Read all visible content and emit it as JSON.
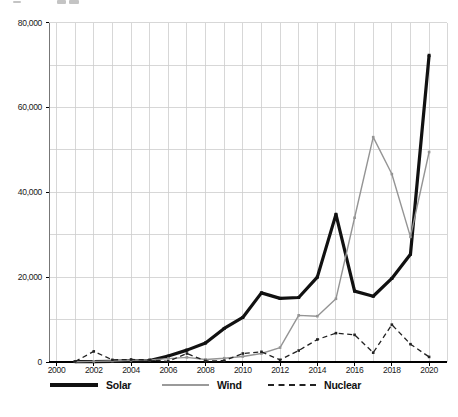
{
  "chart_data": {
    "type": "line",
    "title": "",
    "xlabel": "",
    "ylabel": "",
    "x_axis": {
      "min": 2000,
      "max": 2021,
      "gridline_every_years": 1,
      "labeled_ticks": [
        2000,
        2002,
        2004,
        2006,
        2008,
        2010,
        2012,
        2014,
        2016,
        2018,
        2020
      ]
    },
    "y_axis": {
      "min": 0,
      "max": 80000,
      "gridline_every": 10000,
      "labeled_ticks": [
        {
          "value": 0,
          "label": "0"
        },
        {
          "value": 20000,
          "label": "20,000"
        },
        {
          "value": 40000,
          "label": "40,000"
        },
        {
          "value": 60000,
          "label": "60,000"
        },
        {
          "value": 80000,
          "label": "80,000"
        }
      ]
    },
    "grid": true,
    "legend_position": "bottom",
    "years": [
      2001,
      2002,
      2003,
      2004,
      2005,
      2006,
      2007,
      2008,
      2009,
      2010,
      2011,
      2012,
      2013,
      2014,
      2015,
      2016,
      2017,
      2018,
      2019,
      2020
    ],
    "series": [
      {
        "name": "Solar",
        "color": "#111111",
        "line_style": "solid",
        "line_width": 3.2,
        "values": [
          100,
          100,
          150,
          250,
          350,
          1400,
          2800,
          4500,
          7900,
          10500,
          16300,
          15000,
          15200,
          20000,
          34800,
          16700,
          15500,
          19700,
          25400,
          72300
        ]
      },
      {
        "name": "Wind",
        "color": "#949494",
        "line_style": "solid",
        "line_width": 1.4,
        "values": [
          50,
          150,
          250,
          400,
          500,
          800,
          1100,
          600,
          900,
          1300,
          2000,
          3400,
          11000,
          10800,
          14900,
          34000,
          53000,
          44300,
          29500,
          49500
        ]
      },
      {
        "name": "Nuclear",
        "color": "#222222",
        "line_style": "dashed",
        "line_width": 1.3,
        "values": [
          100,
          2500,
          500,
          600,
          500,
          150,
          2000,
          250,
          300,
          2000,
          2400,
          500,
          2700,
          5300,
          6800,
          6400,
          2200,
          8800,
          4200,
          1200
        ]
      }
    ]
  }
}
